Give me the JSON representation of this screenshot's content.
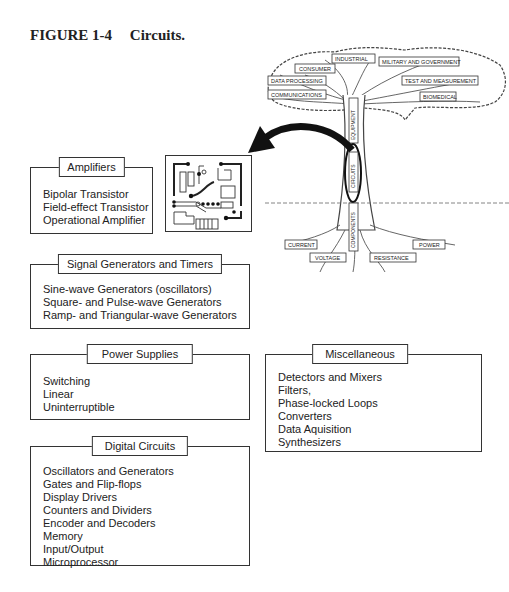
{
  "figure": {
    "number": "FIGURE 1-4",
    "caption": "Circuits."
  },
  "tree": {
    "branches": [
      "INDUSTRIAL",
      "CONSUMER",
      "MILITARY AND GOVERNMENT",
      "DATA PROCESSING",
      "TEST AND MEASUREMENT",
      "COMMUNICATIONS",
      "BIOMEDICAL"
    ],
    "trunk": [
      "EQUIPMENT",
      "CIRCUITS",
      "COMPONENTS"
    ],
    "roots": [
      "CURRENT",
      "POWER",
      "VOLTAGE",
      "RESISTANCE"
    ]
  },
  "boxes": {
    "amplifiers": {
      "title": "Amplifiers",
      "items": [
        "Bipolar Transistor",
        "Field-effect Transistor",
        "Operational Amplifier"
      ]
    },
    "signal_generators": {
      "title": "Signal Generators and Timers",
      "items": [
        "Sine-wave Generators (oscillators)",
        "Square- and Pulse-wave Generators",
        "Ramp- and Triangular-wave Generators"
      ]
    },
    "power_supplies": {
      "title": "Power Supplies",
      "items": [
        "Switching",
        "Linear",
        "Uninterruptible"
      ]
    },
    "miscellaneous": {
      "title": "Miscellaneous",
      "items": [
        "Detectors and Mixers",
        "Filters,",
        "Phase-locked Loops",
        "Converters",
        "Data Aquisition",
        "Synthesizers"
      ]
    },
    "digital_circuits": {
      "title": "Digital Circuits",
      "items": [
        "Oscillators and Generators",
        "Gates and Flip-flops",
        "Display Drivers",
        "Counters and Dividers",
        "Encoder and Decoders",
        "Memory",
        "Input/Output",
        "Microprocessor"
      ]
    }
  }
}
